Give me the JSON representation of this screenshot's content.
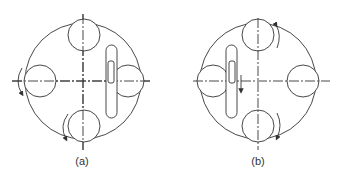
{
  "figure": {
    "panels": [
      {
        "id": "a",
        "label": "(a)",
        "slot_position": "right",
        "slot_orientation": "vertical",
        "rotation_arrows": "counterclockwise (left and bottom wheels)"
      },
      {
        "id": "b",
        "label": "(b)",
        "slot_position": "left",
        "slot_orientation": "vertical",
        "rotation_arrows": "clockwise (top and bottom wheels)",
        "slider_arrow": "down"
      }
    ],
    "stroke_color": "#333333",
    "background_color": "#ffffff"
  }
}
